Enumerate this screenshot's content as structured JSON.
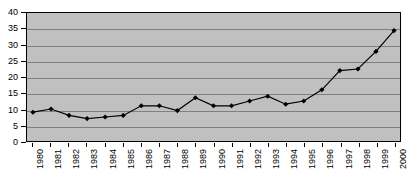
{
  "chart_data": {
    "type": "line",
    "title": "",
    "xlabel": "",
    "ylabel": "",
    "categories": [
      "1980",
      "1981",
      "1982",
      "1983",
      "1984",
      "1985",
      "1986",
      "1987",
      "1988",
      "1989",
      "1990",
      "1991",
      "1992",
      "1993",
      "1994",
      "1995",
      "1996",
      "1997",
      "1998",
      "1999",
      "2000"
    ],
    "values": [
      9,
      10,
      8,
      7,
      7.5,
      8,
      11,
      11,
      9.5,
      13.5,
      11,
      11,
      12.5,
      14,
      11.5,
      12.5,
      16,
      22,
      22.5,
      28,
      34.5
    ],
    "series": [
      {
        "name": "series-1",
        "values": [
          9,
          10,
          8,
          7,
          7.5,
          8,
          11,
          11,
          9.5,
          13.5,
          11,
          11,
          12.5,
          14,
          11.5,
          12.5,
          16,
          22,
          22.5,
          28,
          34.5
        ]
      }
    ],
    "ylim": [
      0,
      40
    ],
    "ytick_step": 5,
    "yticks": [
      0,
      5,
      10,
      15,
      20,
      25,
      30,
      35,
      40
    ],
    "ytick_labels": [
      "0",
      "5",
      "10",
      "15",
      "20",
      "25",
      "30",
      "35",
      "40"
    ],
    "grid": true,
    "grid_axis": "y",
    "legend": false,
    "legend_position": "none",
    "marker": "diamond",
    "colors": {
      "plot_background": "#c0c0c0",
      "page_background": "#ffffff",
      "gridline": "#808080",
      "axis": "#000000",
      "series_line": "#000000",
      "marker_fill": "#000000",
      "text": "#000000"
    }
  }
}
